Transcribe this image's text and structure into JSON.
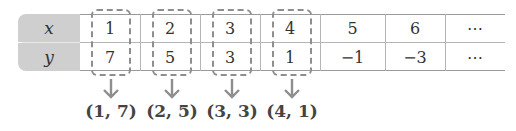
{
  "table": {
    "headers": {
      "x": "x",
      "y": "y"
    },
    "x_values": [
      "1",
      "2",
      "3",
      "4",
      "5",
      "6",
      "⋯"
    ],
    "y_values": [
      "7",
      "5",
      "3",
      "1",
      "−1",
      "−3",
      "⋯"
    ]
  },
  "pairs": [
    "(1, 7)",
    "(2, 5)",
    "(3, 3)",
    "(4, 1)"
  ],
  "colors": {
    "header_bg": "#cfcfcf",
    "dash": "#8e8e8e",
    "arrow": "#8e8e8e"
  }
}
